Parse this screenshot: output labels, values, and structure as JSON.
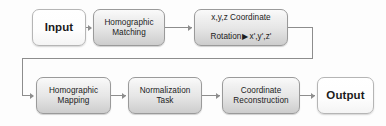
{
  "diagram": {
    "type": "flowchart",
    "colors": {
      "background": "#fdfdfd",
      "process_fill_top": "#fafafa",
      "process_fill_bottom": "#cdcdcd",
      "process_border": "#9a9a9a",
      "terminal_fill": "#ffffff",
      "terminal_border": "#b5b5b5",
      "connector": "#8d8d8d",
      "text": "#1b1b1b"
    },
    "nodes": [
      {
        "id": "input",
        "kind": "terminal",
        "label": "Input"
      },
      {
        "id": "homog-matching",
        "kind": "process",
        "label": "Homographic\nMatching"
      },
      {
        "id": "rotation",
        "kind": "process",
        "line1": "x,y,z Coordinate",
        "line2_prefix": "Rotation",
        "arrow_glyph": "▶",
        "line2_suffix": "x',y',z'",
        "label": "x,y,z Coordinate\nRotation ▶ x',y',z'"
      },
      {
        "id": "homog-mapping",
        "kind": "process",
        "label": "Homographic\nMapping"
      },
      {
        "id": "normalization",
        "kind": "process",
        "label": "Normalization\nTask"
      },
      {
        "id": "coord-recon",
        "kind": "process",
        "label": "Coordinate\nReconstruction"
      },
      {
        "id": "output",
        "kind": "terminal",
        "label": "Output"
      }
    ],
    "edges": [
      {
        "from": "input",
        "to": "homog-matching",
        "style": "straight-arrow"
      },
      {
        "from": "homog-matching",
        "to": "rotation",
        "style": "straight-arrow"
      },
      {
        "from": "rotation",
        "to": "homog-mapping",
        "style": "elbow-wrap-arrow"
      },
      {
        "from": "homog-mapping",
        "to": "normalization",
        "style": "straight-arrow"
      },
      {
        "from": "normalization",
        "to": "coord-recon",
        "style": "straight-arrow"
      },
      {
        "from": "coord-recon",
        "to": "output",
        "style": "straight-arrow"
      }
    ]
  }
}
